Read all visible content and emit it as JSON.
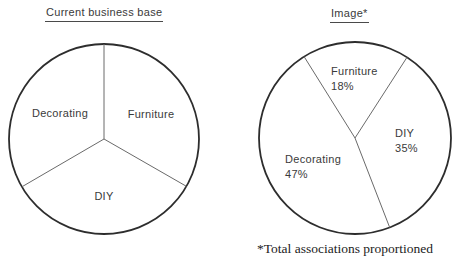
{
  "page": {
    "background": "#ffffff"
  },
  "colors": {
    "outline": "#2d2d2d",
    "divider": "#6a6a6a",
    "text": "#3a3a3a",
    "footnote_text": "#222222"
  },
  "footnote": "*Total associations proportioned",
  "chart_data": [
    {
      "type": "pie",
      "title": "Current business base",
      "labels": [
        "Furniture",
        "DIY",
        "Decorating"
      ],
      "values": [
        33.3,
        33.3,
        33.4
      ],
      "percent_labels_shown": false,
      "geometry": {
        "cx": 104,
        "cy": 139,
        "r": 95,
        "start_angle_deg": 90,
        "direction": "clockwise"
      },
      "slices": [
        {
          "name": "Furniture",
          "value": 33.3,
          "pct_label": "",
          "label_x": 151,
          "label_y": 107,
          "align": "center"
        },
        {
          "name": "DIY",
          "value": 33.3,
          "pct_label": "",
          "label_x": 104,
          "label_y": 189,
          "align": "center"
        },
        {
          "name": "Decorating",
          "value": 33.4,
          "pct_label": "",
          "label_x": 60,
          "label_y": 106,
          "align": "center"
        }
      ]
    },
    {
      "type": "pie",
      "title": "Image*",
      "labels": [
        "Furniture",
        "DIY",
        "Decorating"
      ],
      "values": [
        18,
        35,
        47
      ],
      "percent_labels_shown": true,
      "geometry": {
        "cx": 355,
        "cy": 138,
        "r": 96,
        "start_angle_deg": 122,
        "direction": "clockwise"
      },
      "slices": [
        {
          "name": "Furniture",
          "value": 18,
          "pct_label": "18%",
          "label_x": 331,
          "label_y": 64,
          "align": "left"
        },
        {
          "name": "DIY",
          "value": 35,
          "pct_label": "35%",
          "label_x": 395,
          "label_y": 126,
          "align": "left"
        },
        {
          "name": "Decorating",
          "value": 47,
          "pct_label": "47%",
          "label_x": 285,
          "label_y": 152,
          "align": "left"
        }
      ]
    }
  ]
}
